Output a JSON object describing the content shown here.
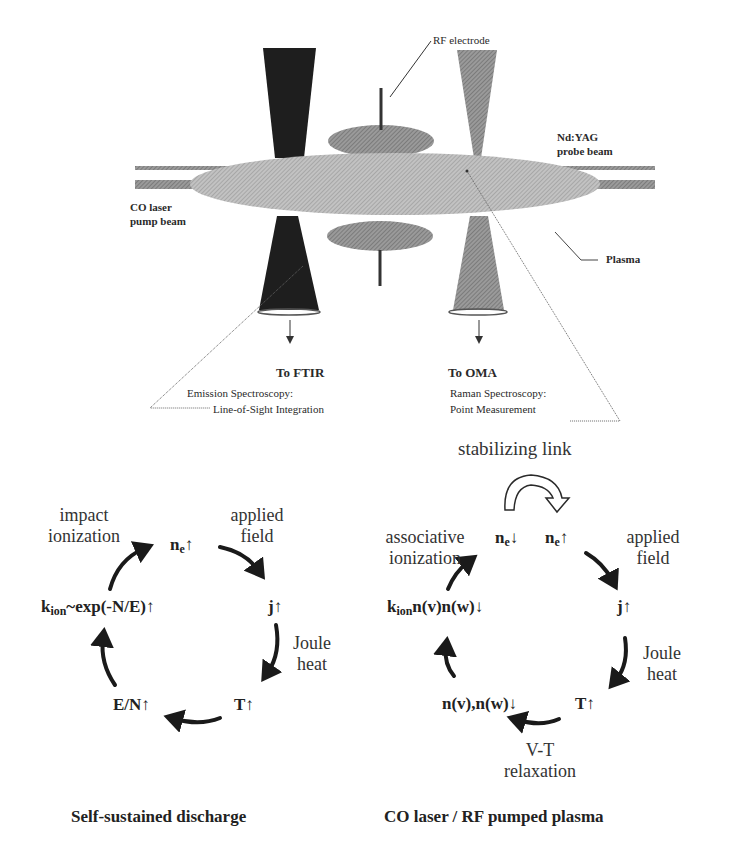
{
  "apparatus": {
    "labels": {
      "rf_electrode": "RF electrode",
      "nd_yag_line1": "Nd:YAG",
      "nd_yag_line2": "probe beam",
      "co_laser_line1": "CO laser",
      "co_laser_line2": "pump beam",
      "plasma": "Plasma",
      "to_ftir": "To FTIR",
      "to_oma": "To OMA",
      "emission_line1": "Emission Spectroscopy:",
      "emission_line2": "Line-of-Sight Integration",
      "raman_line1": "Raman Spectroscopy:",
      "raman_line2": "Point Measurement"
    }
  },
  "cycle_left": {
    "title": "Self-sustained discharge",
    "nodes": {
      "ne": {
        "base": "n",
        "sub": "e",
        "arrow": "↑"
      },
      "j": {
        "base": "j",
        "arrow": "↑"
      },
      "T": {
        "base": "T",
        "arrow": "↑"
      },
      "EN": {
        "base": "E/N",
        "arrow": "↑"
      },
      "kion": {
        "base": "k",
        "sub": "ion",
        "rest": "~exp(-N/E)",
        "arrow": "↑"
      }
    },
    "processes": {
      "impact_line1": "impact",
      "impact_line2": "ionization",
      "applied_line1": "applied",
      "applied_line2": "field",
      "joule_line1": "Joule",
      "joule_line2": "heat"
    }
  },
  "cycle_right": {
    "title": "CO laser / RF pumped plasma",
    "stabilizing_link": "stabilizing link",
    "nodes": {
      "ne_down": {
        "base": "n",
        "sub": "e",
        "arrow": "↓"
      },
      "ne_up": {
        "base": "n",
        "sub": "e",
        "arrow": "↑"
      },
      "j": {
        "base": "j",
        "arrow": "↑"
      },
      "T": {
        "base": "T",
        "arrow": "↑"
      },
      "nvnw": {
        "base": "n(v),n(w)",
        "arrow": "↓"
      },
      "kion": {
        "base": "k",
        "sub": "ion",
        "rest": "n(v)n(w)",
        "arrow": "↓"
      }
    },
    "processes": {
      "assoc_line1": "associative",
      "assoc_line2": "ionization",
      "applied_line1": "applied",
      "applied_line2": "field",
      "joule_line1": "Joule",
      "joule_line2": "heat",
      "vt_line1": "V-T",
      "vt_line2": "relaxation"
    }
  },
  "colors": {
    "dark_cone": "#1e1e1e",
    "light_cone": "#8f8f8f",
    "plasma_fill": "#b4b4b4",
    "electrode_fill": "#8a8a8a",
    "beam_fill": "#9a9a9a",
    "text": "#222222"
  }
}
